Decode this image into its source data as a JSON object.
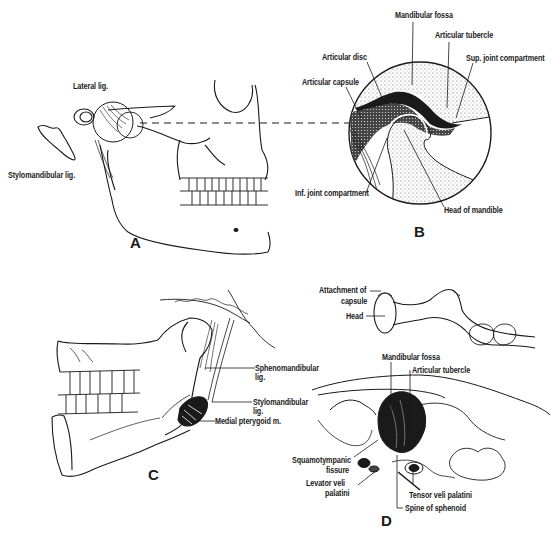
{
  "figure": {
    "panels": {
      "A": {
        "letter": "A",
        "labels": [
          "Lateral lig.",
          "Stylomandibular lig."
        ]
      },
      "B": {
        "letter": "B",
        "labels": [
          "Mandibular fossa",
          "Articular tubercle",
          "Articular disc",
          "Sup. joint compartment",
          "Articular capsule",
          "Inf. joint compartment",
          "Head of mandible"
        ]
      },
      "C": {
        "letter": "C",
        "labels": [
          "Sphenomandibular",
          "lig.",
          "Stylomandibular",
          "lig.",
          "Medial pterygoid m."
        ]
      },
      "D": {
        "letter": "D",
        "labels": [
          "Attachment of",
          "capsule",
          "Head",
          "Mandibular fossa",
          "Articular tubercle",
          "Squamotympanic",
          "fissure",
          "Levator veli",
          "palatini",
          "Tensor veli palatini",
          "Spine of sphenoid"
        ]
      }
    },
    "colors": {
      "ink": "#1a1a1a",
      "background": "#ffffff",
      "stipple": "#888888"
    }
  }
}
